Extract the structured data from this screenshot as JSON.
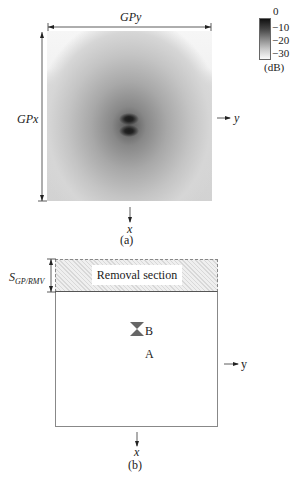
{
  "panel_a": {
    "top_dim_label": "GPy",
    "left_dim_label": "GPx",
    "right_axis_label": "y",
    "bottom_axis_label": "x",
    "caption": "(a)",
    "colorbar": {
      "ticks": [
        "0",
        "−10",
        "−20",
        "−30"
      ],
      "unit": "(dB)"
    }
  },
  "panel_b": {
    "removal_label": "Removal section",
    "dim_label_main": "S",
    "dim_label_sub": "GP/RMV",
    "marker_top_label": "B",
    "marker_bottom_label": "A",
    "right_axis_label": "y",
    "bottom_axis_label": "x",
    "caption": "(b)"
  }
}
